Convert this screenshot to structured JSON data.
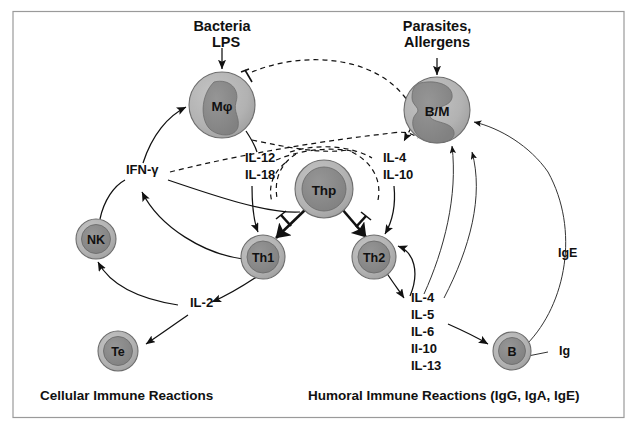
{
  "figure": {
    "frame_color": "#9a9a9a",
    "background": "#ffffff"
  },
  "palette": {
    "cell_cytoplasm": "#b3b3b3",
    "cell_nucleus": "#8a8a8a",
    "cell_outline": "#6d6d6d",
    "line": "#111111",
    "text": "#111111"
  },
  "stimuli": [
    {
      "id": "bacteria",
      "lines": [
        "Bacteria",
        "LPS"
      ],
      "target": "Mphi"
    },
    {
      "id": "parasites",
      "lines": [
        "Parasites,",
        "Allergens"
      ],
      "target": "BM"
    }
  ],
  "cells": [
    {
      "id": "Mphi",
      "label": "Mφ",
      "kind": "macrophage",
      "cx": 222,
      "cy": 105,
      "r": 33
    },
    {
      "id": "BM",
      "label": "B/M",
      "kind": "mast",
      "cx": 437,
      "cy": 110,
      "r": 33
    },
    {
      "id": "Thp",
      "label": "Thp",
      "kind": "lymphocyte",
      "cx": 324,
      "cy": 189,
      "r": 29
    },
    {
      "id": "Th1",
      "label": "Th1",
      "kind": "lymphocyte",
      "cx": 263,
      "cy": 257,
      "r": 22
    },
    {
      "id": "Th2",
      "label": "Th2",
      "kind": "lymphocyte",
      "cx": 374,
      "cy": 257,
      "r": 22
    },
    {
      "id": "NK",
      "label": "NK",
      "kind": "lymphocyte",
      "cx": 96,
      "cy": 239,
      "r": 20
    },
    {
      "id": "Te",
      "label": "Te",
      "kind": "lymphocyte",
      "cx": 118,
      "cy": 351,
      "r": 20
    },
    {
      "id": "B",
      "label": "B",
      "kind": "lymphocyte",
      "cx": 512,
      "cy": 351,
      "r": 19
    }
  ],
  "cytokine_labels": [
    {
      "id": "ifng",
      "text": "IFN-γ",
      "x": 126,
      "y": 174
    },
    {
      "id": "il12",
      "text": "IL-12",
      "x": 245,
      "y": 162
    },
    {
      "id": "il18",
      "text": "IL-18",
      "x": 245,
      "y": 179
    },
    {
      "id": "il4t",
      "text": "IL-4",
      "x": 383,
      "y": 162
    },
    {
      "id": "il10t",
      "text": "IL-10",
      "x": 383,
      "y": 179
    },
    {
      "id": "il2",
      "text": "IL-2",
      "x": 190,
      "y": 307
    },
    {
      "id": "ige",
      "text": "IgE",
      "x": 558,
      "y": 257
    },
    {
      "id": "ig",
      "text": "Ig",
      "x": 559,
      "y": 355
    }
  ],
  "th2_cytokine_stack": {
    "x": 411,
    "y_start": 302,
    "line_height": 17,
    "items": [
      "IL-4",
      "IL-5",
      "IL-6",
      "Il-10",
      "IL-13"
    ]
  },
  "captions": [
    {
      "id": "cellular",
      "text": "Cellular Immune Reactions",
      "x": 40,
      "y": 400
    },
    {
      "id": "humoral",
      "text": "Humoral Immune Reactions (IgG, IgA, IgE)",
      "x": 308,
      "y": 400
    }
  ],
  "relationships": [
    {
      "from": "Bacteria/LPS",
      "to": "Mφ",
      "type": "stimulate"
    },
    {
      "from": "Parasites/Allergens",
      "to": "B/M",
      "type": "stimulate"
    },
    {
      "from": "Mφ",
      "to": "IL-12 IL-18",
      "type": "produce"
    },
    {
      "from": "IL-12 IL-18",
      "to": "Th1",
      "type": "promote"
    },
    {
      "from": "Thp",
      "to": "Th1",
      "type": "differentiate"
    },
    {
      "from": "Thp",
      "to": "Th2",
      "type": "differentiate"
    },
    {
      "from": "B/M",
      "to": "IL-4 IL-10",
      "type": "produce"
    },
    {
      "from": "IL-4 IL-10",
      "to": "Th2",
      "type": "promote"
    },
    {
      "from": "IL-4 IL-10",
      "to": "Th1",
      "type": "inhibit"
    },
    {
      "from": "IFN-γ",
      "to": "Th2",
      "type": "inhibit"
    },
    {
      "from": "IFN-γ",
      "to": "Mφ",
      "type": "activate"
    },
    {
      "from": "Th1",
      "to": "IFN-γ",
      "type": "produce"
    },
    {
      "from": "NK",
      "to": "IFN-γ",
      "type": "produce"
    },
    {
      "from": "Th1",
      "to": "IL-2",
      "type": "produce"
    },
    {
      "from": "IL-2",
      "to": "NK",
      "type": "activate"
    },
    {
      "from": "IL-2",
      "to": "Te",
      "type": "activate"
    },
    {
      "from": "Th2",
      "to": "IL-4 IL-5 IL-6 Il-10 IL-13",
      "type": "produce"
    },
    {
      "from": "IL-4 IL-5 IL-6 Il-10 IL-13",
      "to": "B",
      "type": "activate"
    },
    {
      "from": "IL-4",
      "to": "Th2",
      "type": "autocrine"
    },
    {
      "from": "IL-4 cytokines",
      "to": "B/M",
      "type": "activate"
    },
    {
      "from": "B",
      "to": "Ig / IgE",
      "type": "secrete"
    },
    {
      "from": "IgE",
      "to": "B/M",
      "type": "arm"
    },
    {
      "from": "IFN-γ",
      "to": "B/M",
      "type": "inhibit"
    }
  ]
}
